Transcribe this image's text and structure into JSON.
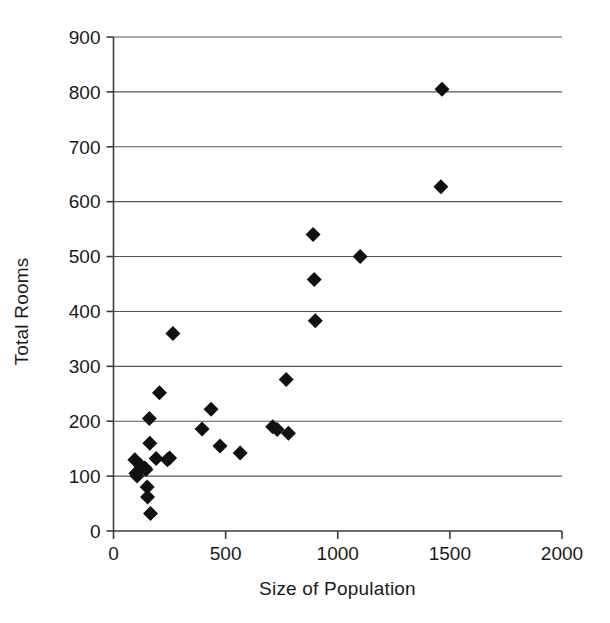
{
  "chart_data": {
    "type": "scatter",
    "title": "",
    "subtitle": "",
    "xlabel": "Size of Population",
    "ylabel": "Total Rooms",
    "xlim": [
      0,
      2000
    ],
    "ylim": [
      0,
      900
    ],
    "xticks": [
      0,
      500,
      1000,
      1500,
      2000
    ],
    "yticks": [
      0,
      100,
      200,
      300,
      400,
      500,
      600,
      700,
      800,
      900
    ],
    "xtick_labels": [
      "0",
      "500",
      "1000",
      "1500",
      "2000"
    ],
    "ytick_labels": [
      "0",
      "100",
      "200",
      "300",
      "400",
      "500",
      "600",
      "700",
      "800",
      "900"
    ],
    "grid": "horizontal",
    "legend": null,
    "legend_position": "none",
    "marker": {
      "shape": "diamond",
      "color": "#111111",
      "size_px": 15
    },
    "series": [
      {
        "name": "Communities",
        "points": [
          [
            95,
            130
          ],
          [
            100,
            105
          ],
          [
            105,
            100
          ],
          [
            120,
            120
          ],
          [
            140,
            115
          ],
          [
            145,
            112
          ],
          [
            150,
            80
          ],
          [
            152,
            62
          ],
          [
            160,
            205
          ],
          [
            162,
            160
          ],
          [
            165,
            32
          ],
          [
            190,
            132
          ],
          [
            205,
            252
          ],
          [
            240,
            130
          ],
          [
            250,
            133
          ],
          [
            265,
            360
          ],
          [
            395,
            186
          ],
          [
            435,
            222
          ],
          [
            475,
            155
          ],
          [
            565,
            142
          ],
          [
            710,
            190
          ],
          [
            730,
            185
          ],
          [
            770,
            276
          ],
          [
            780,
            178
          ],
          [
            890,
            540
          ],
          [
            895,
            458
          ],
          [
            900,
            383
          ],
          [
            1100,
            500
          ],
          [
            1460,
            627
          ],
          [
            1465,
            805
          ]
        ]
      }
    ]
  },
  "axis": {
    "x_title": "Size of Population",
    "y_title": "Total Rooms"
  }
}
